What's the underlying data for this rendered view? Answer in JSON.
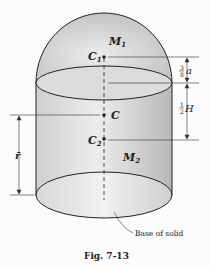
{
  "figure": {
    "caption": "Fig. 7-13",
    "labels": {
      "top_mass": "M",
      "top_mass_sub": "1",
      "top_centroid": "C",
      "top_centroid_sub": "1",
      "overall_centroid": "C",
      "bottom_centroid": "C",
      "bottom_centroid_sub": "2",
      "bottom_mass": "M",
      "bottom_mass_sub": "2",
      "r_bar": "r̄",
      "dim_top_frac_num": "3",
      "dim_top_frac_den": "8",
      "dim_top_var": "a",
      "dim_bottom_frac_num": "1",
      "dim_bottom_frac_den": "2",
      "dim_bottom_var": "H",
      "base_note": "Base of solid"
    },
    "colors": {
      "ink": "#222222",
      "fill_light": "#e6e6e6",
      "fill_dark": "#bcbcbc"
    }
  }
}
